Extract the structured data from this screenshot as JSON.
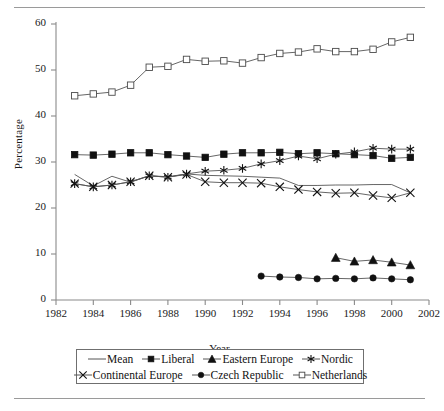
{
  "figure": {
    "rules": [
      "top-rule",
      "bottom-rule"
    ]
  },
  "chart_data": {
    "type": "line",
    "title": "",
    "xlabel": "Year",
    "ylabel": "Percentage",
    "xlim": [
      1982,
      2002
    ],
    "ylim": [
      0,
      60
    ],
    "xticks": [
      1982,
      1984,
      1986,
      1988,
      1990,
      1992,
      1994,
      1996,
      1998,
      2000,
      2002
    ],
    "yticks": [
      0,
      10,
      20,
      30,
      40,
      50,
      60
    ],
    "grid": false,
    "legend_position": "bottom",
    "series": [
      {
        "name": "Mean",
        "marker": "none",
        "x": [
          1983,
          1984,
          1985,
          1986,
          1987,
          1988,
          1989,
          1990,
          1991,
          1992,
          1993,
          1994,
          1995,
          1996,
          1997,
          1998,
          1999,
          2000,
          2001
        ],
        "values": [
          27.3,
          24.8,
          26.9,
          25.6,
          27.0,
          26.8,
          27.4,
          27.1,
          27.0,
          26.9,
          26.7,
          26.5,
          24.9,
          24.9,
          25.0,
          25.0,
          25.1,
          25.1,
          23.3
        ]
      },
      {
        "name": "Liberal",
        "marker": "filled-square",
        "x": [
          1983,
          1984,
          1985,
          1986,
          1987,
          1988,
          1989,
          1990,
          1991,
          1992,
          1993,
          1994,
          1995,
          1996,
          1997,
          1998,
          1999,
          2000,
          2001
        ],
        "values": [
          31.6,
          31.5,
          31.7,
          32.0,
          32.0,
          31.6,
          31.3,
          31.0,
          31.7,
          32.0,
          32.0,
          32.1,
          31.8,
          32.0,
          31.8,
          31.6,
          31.4,
          30.8,
          31.0
        ]
      },
      {
        "name": "Eastern Europe",
        "marker": "filled-triangle",
        "x": [
          1997,
          1998,
          1999,
          2000,
          2001
        ],
        "values": [
          9.2,
          8.4,
          8.7,
          8.2,
          7.6
        ]
      },
      {
        "name": "Nordic",
        "marker": "asterisk",
        "x": [
          1983,
          1984,
          1985,
          1986,
          1987,
          1988,
          1989,
          1990,
          1991,
          1992,
          1993,
          1994,
          1995,
          1996,
          1997,
          1998,
          1999,
          2000,
          2001
        ],
        "values": [
          25.3,
          24.6,
          25.0,
          25.7,
          27.0,
          26.7,
          27.4,
          28.0,
          28.2,
          28.6,
          29.6,
          30.3,
          31.3,
          30.7,
          31.7,
          32.2,
          33.0,
          32.8,
          32.8
        ]
      },
      {
        "name": "Continental Europe",
        "marker": "x-cross",
        "x": [
          1983,
          1984,
          1985,
          1986,
          1987,
          1988,
          1989,
          1990,
          1991,
          1992,
          1993,
          1994,
          1995,
          1996,
          1997,
          1998,
          1999,
          2000,
          2001
        ],
        "values": [
          25.3,
          24.6,
          25.0,
          25.7,
          27.0,
          26.7,
          27.3,
          25.7,
          25.5,
          25.5,
          25.4,
          24.6,
          24.0,
          23.5,
          23.2,
          23.3,
          22.7,
          22.2,
          23.3
        ]
      },
      {
        "name": "Czech Republic",
        "marker": "filled-circle",
        "x": [
          1993,
          1994,
          1995,
          1996,
          1997,
          1998,
          1999,
          2000,
          2001
        ],
        "values": [
          5.2,
          5.0,
          4.9,
          4.6,
          4.7,
          4.6,
          4.8,
          4.6,
          4.4
        ]
      },
      {
        "name": "Netherlands",
        "marker": "open-square",
        "x": [
          1983,
          1984,
          1985,
          1986,
          1987,
          1988,
          1989,
          1990,
          1991,
          1992,
          1993,
          1994,
          1995,
          1996,
          1997,
          1998,
          1999,
          2000,
          2001
        ],
        "values": [
          44.4,
          44.8,
          45.2,
          46.7,
          50.6,
          50.8,
          52.3,
          51.9,
          52.0,
          51.5,
          52.7,
          53.6,
          53.9,
          54.6,
          54.0,
          54.0,
          54.5,
          56.1,
          57.1
        ]
      }
    ],
    "colors": {
      "line": "#555555",
      "marker": "#111111",
      "axis": "#8a8a8a",
      "text": "#1a1a1a"
    }
  },
  "legend": {
    "rows": [
      [
        {
          "label": "Mean",
          "marker": "none"
        },
        {
          "label": "Liberal",
          "marker": "filled-square"
        },
        {
          "label": "Eastern Europe",
          "marker": "filled-triangle"
        },
        {
          "label": "Nordic",
          "marker": "asterisk"
        }
      ],
      [
        {
          "label": "Continental Europe",
          "marker": "x-cross"
        },
        {
          "label": "Czech Republic",
          "marker": "filled-circle"
        },
        {
          "label": "Netherlands",
          "marker": "open-square"
        }
      ]
    ]
  }
}
